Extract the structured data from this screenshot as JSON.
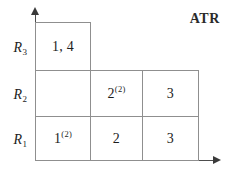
{
  "diagram": {
    "corner_label": "ATR",
    "axes": {
      "vertical_axis_name": "vertical-axis",
      "horizontal_axis_name": "horizontal-axis"
    },
    "row_labels": [
      {
        "key": "R3",
        "base": "R",
        "sub": "3"
      },
      {
        "key": "R2",
        "base": "R",
        "sub": "2"
      },
      {
        "key": "R1",
        "base": "R",
        "sub": "1"
      }
    ],
    "cells": {
      "r3_c1": {
        "text": "1, 4",
        "sup": ""
      },
      "r2_c1": {
        "text": "",
        "sup": ""
      },
      "r2_c2": {
        "text": "2",
        "sup": "(2)"
      },
      "r2_c3": {
        "text": "3",
        "sup": ""
      },
      "r1_c1": {
        "text": "1",
        "sup": "(2)"
      },
      "r1_c2": {
        "text": "2",
        "sup": ""
      },
      "r1_c3": {
        "text": "3",
        "sup": ""
      }
    }
  }
}
